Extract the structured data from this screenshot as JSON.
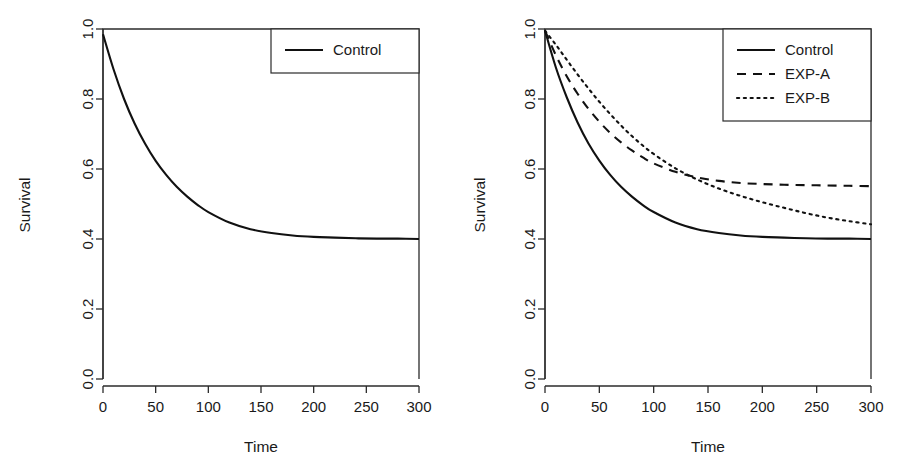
{
  "figure": {
    "background": "#ffffff",
    "line_color": "#111111",
    "axis_color": "#2b2b2b",
    "panels": [
      "left",
      "right"
    ]
  },
  "chart_data": [
    {
      "type": "line",
      "panel": "left",
      "title": "",
      "xlabel": "Time",
      "ylabel": "Survival",
      "xlim": [
        0,
        300
      ],
      "ylim": [
        0.0,
        1.0
      ],
      "xticks": [
        0,
        50,
        100,
        150,
        200,
        250,
        300
      ],
      "xtick_labels": [
        "0",
        "50",
        "100",
        "150",
        "200",
        "250",
        "300"
      ],
      "yticks": [
        0.0,
        0.2,
        0.4,
        0.6,
        0.8,
        1.0
      ],
      "ytick_labels": [
        "0.0",
        "0.2",
        "0.4",
        "0.6",
        "0.8",
        "1.0"
      ],
      "grid": false,
      "legend_position": "top-right",
      "legend": [
        "Control"
      ],
      "x": [
        0,
        10,
        20,
        30,
        40,
        50,
        60,
        70,
        80,
        90,
        100,
        120,
        140,
        160,
        180,
        200,
        220,
        240,
        260,
        280,
        300
      ],
      "series": [
        {
          "name": "Control",
          "style": "solid",
          "values": [
            0.985,
            0.885,
            0.8,
            0.73,
            0.672,
            0.623,
            0.583,
            0.549,
            0.521,
            0.497,
            0.477,
            0.447,
            0.428,
            0.417,
            0.41,
            0.406,
            0.404,
            0.402,
            0.401,
            0.401,
            0.4
          ]
        }
      ]
    },
    {
      "type": "line",
      "panel": "right",
      "title": "",
      "xlabel": "Time",
      "ylabel": "Survival",
      "xlim": [
        0,
        300
      ],
      "ylim": [
        0.0,
        1.0
      ],
      "xticks": [
        0,
        50,
        100,
        150,
        200,
        250,
        300
      ],
      "xtick_labels": [
        "0",
        "50",
        "100",
        "150",
        "200",
        "250",
        "300"
      ],
      "yticks": [
        0.0,
        0.2,
        0.4,
        0.6,
        0.8,
        1.0
      ],
      "ytick_labels": [
        "0.0",
        "0.2",
        "0.4",
        "0.6",
        "0.8",
        "1.0"
      ],
      "grid": false,
      "legend_position": "top-right",
      "legend": [
        "Control",
        "EXP-A",
        "EXP-B"
      ],
      "x": [
        0,
        10,
        20,
        30,
        40,
        50,
        60,
        70,
        80,
        90,
        100,
        120,
        140,
        160,
        180,
        200,
        220,
        240,
        260,
        280,
        300
      ],
      "series": [
        {
          "name": "Control",
          "style": "solid",
          "values": [
            0.995,
            0.89,
            0.805,
            0.733,
            0.673,
            0.624,
            0.583,
            0.549,
            0.521,
            0.497,
            0.477,
            0.447,
            0.428,
            0.417,
            0.41,
            0.406,
            0.404,
            0.402,
            0.401,
            0.401,
            0.4
          ]
        },
        {
          "name": "EXP-A",
          "style": "dashed",
          "values": [
            0.995,
            0.925,
            0.865,
            0.815,
            0.772,
            0.735,
            0.703,
            0.676,
            0.653,
            0.633,
            0.616,
            0.592,
            0.576,
            0.566,
            0.56,
            0.557,
            0.555,
            0.554,
            0.553,
            0.552,
            0.551
          ]
        },
        {
          "name": "EXP-B",
          "style": "dotted",
          "values": [
            0.995,
            0.955,
            0.912,
            0.87,
            0.83,
            0.792,
            0.757,
            0.724,
            0.694,
            0.667,
            0.643,
            0.602,
            0.57,
            0.544,
            0.523,
            0.505,
            0.489,
            0.474,
            0.461,
            0.451,
            0.442
          ]
        }
      ]
    }
  ],
  "panel_left": {
    "ylabel": "Survival",
    "xlabel": "Time",
    "xtick_labels": [
      "0",
      "50",
      "100",
      "150",
      "200",
      "250",
      "300"
    ],
    "ytick_labels": [
      "0.0",
      "0.2",
      "0.4",
      "0.6",
      "0.8",
      "1.0"
    ],
    "legend": {
      "items": [
        {
          "label": "Control",
          "style": "solid"
        }
      ]
    }
  },
  "panel_right": {
    "ylabel": "Survival",
    "xlabel": "Time",
    "xtick_labels": [
      "0",
      "50",
      "100",
      "150",
      "200",
      "250",
      "300"
    ],
    "ytick_labels": [
      "0.0",
      "0.2",
      "0.4",
      "0.6",
      "0.8",
      "1.0"
    ],
    "legend": {
      "items": [
        {
          "label": "Control",
          "style": "solid"
        },
        {
          "label": "EXP-A",
          "style": "dashed"
        },
        {
          "label": "EXP-B",
          "style": "dotted"
        }
      ]
    }
  }
}
